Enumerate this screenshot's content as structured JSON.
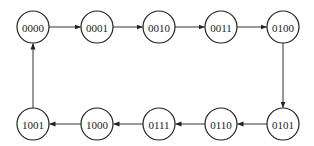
{
  "diagram": {
    "type": "state-transition",
    "radius": 16,
    "colors": {
      "stroke": "#222222",
      "edge": "#333333",
      "background": "#ffffff"
    },
    "states": [
      {
        "id": "s0",
        "label": "0000",
        "x": 33,
        "y": 27
      },
      {
        "id": "s1",
        "label": "0001",
        "x": 97,
        "y": 27
      },
      {
        "id": "s2",
        "label": "0010",
        "x": 159,
        "y": 27
      },
      {
        "id": "s3",
        "label": "0011",
        "x": 221,
        "y": 27
      },
      {
        "id": "s4",
        "label": "0100",
        "x": 283,
        "y": 27
      },
      {
        "id": "s5",
        "label": "0101",
        "x": 283,
        "y": 124
      },
      {
        "id": "s6",
        "label": "0110",
        "x": 221,
        "y": 124
      },
      {
        "id": "s7",
        "label": "0111",
        "x": 159,
        "y": 124
      },
      {
        "id": "s8",
        "label": "1000",
        "x": 97,
        "y": 124
      },
      {
        "id": "s9",
        "label": "1001",
        "x": 33,
        "y": 124
      }
    ],
    "transitions": [
      {
        "from": "s0",
        "to": "s1"
      },
      {
        "from": "s1",
        "to": "s2"
      },
      {
        "from": "s2",
        "to": "s3"
      },
      {
        "from": "s3",
        "to": "s4"
      },
      {
        "from": "s4",
        "to": "s5"
      },
      {
        "from": "s5",
        "to": "s6"
      },
      {
        "from": "s6",
        "to": "s7"
      },
      {
        "from": "s7",
        "to": "s8"
      },
      {
        "from": "s8",
        "to": "s9"
      },
      {
        "from": "s9",
        "to": "s0"
      }
    ]
  }
}
